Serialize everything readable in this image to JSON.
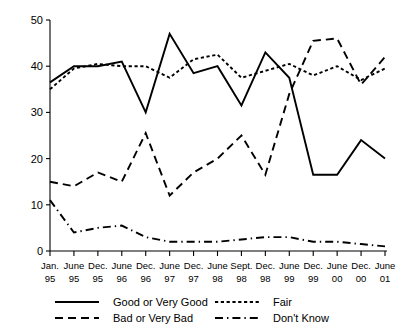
{
  "chart_data": {
    "type": "line",
    "title": "",
    "xlabel": "",
    "ylabel": "",
    "ylim": [
      0,
      50
    ],
    "yticks": [
      0,
      10,
      20,
      30,
      40,
      50
    ],
    "grid": false,
    "legend_position": "bottom",
    "categories": [
      "Jan. 95",
      "June 95",
      "Dec. 95",
      "June 96",
      "Dec. 96",
      "June 97",
      "Dec. 97",
      "June 98",
      "Sept. 98",
      "Dec. 98",
      "June 99",
      "Dec. 99",
      "June 00",
      "Dec. 00",
      "June 01"
    ],
    "category_months": [
      "Jan.",
      "June",
      "Dec.",
      "June",
      "Dec.",
      "June",
      "Dec.",
      "June",
      "Sept.",
      "Dec.",
      "June",
      "Dec.",
      "June",
      "Dec.",
      "June"
    ],
    "category_years": [
      "95",
      "95",
      "95",
      "96",
      "96",
      "97",
      "97",
      "98",
      "98",
      "98",
      "99",
      "99",
      "00",
      "00",
      "01"
    ],
    "series": [
      {
        "name": "Good or Very Good",
        "style": "solid",
        "values": [
          36.5,
          40,
          40,
          41,
          30,
          47,
          38.5,
          40,
          31.5,
          43,
          37.5,
          16.5,
          16.5,
          24,
          20
        ]
      },
      {
        "name": "Fair",
        "style": "dotted",
        "values": [
          35,
          39.5,
          40.5,
          40,
          40,
          37.5,
          41.5,
          42.5,
          37.5,
          39,
          40.5,
          38,
          40,
          37,
          39.5
        ]
      },
      {
        "name": "Bad or Very Bad",
        "style": "dashed",
        "values": [
          15,
          14,
          17,
          15,
          25.5,
          12,
          17,
          20,
          25,
          16.5,
          34,
          45.5,
          46,
          36,
          42
        ]
      },
      {
        "name": "Don't Know",
        "style": "dash-dot",
        "values": [
          11,
          4,
          5,
          5.5,
          3,
          2,
          2,
          2,
          2.5,
          3,
          3,
          2,
          2,
          1.5,
          1
        ]
      }
    ]
  },
  "legend": {
    "items": [
      {
        "label": "Good or Very Good",
        "style": "solid"
      },
      {
        "label": "Fair",
        "style": "dotted"
      },
      {
        "label": "Bad or Very Bad",
        "style": "dashed"
      },
      {
        "label": "Don't Know",
        "style": "dash-dot"
      }
    ]
  },
  "colors": {
    "ink": "#000000",
    "background": "#ffffff"
  }
}
